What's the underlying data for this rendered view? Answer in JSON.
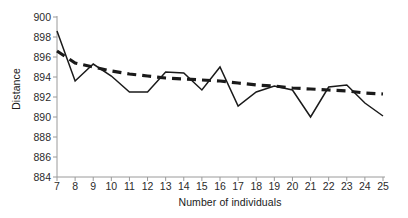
{
  "chart_data": {
    "type": "line",
    "title": "",
    "xlabel": "Number of individuals",
    "ylabel": "Distance",
    "xlim": [
      7,
      25
    ],
    "ylim": [
      884,
      900
    ],
    "ytick_step": 2,
    "grid": false,
    "legend": "none",
    "xticks": [
      7,
      8,
      9,
      10,
      11,
      12,
      13,
      14,
      15,
      16,
      17,
      18,
      19,
      20,
      21,
      22,
      23,
      24,
      25
    ],
    "yticks": [
      884,
      886,
      888,
      890,
      892,
      894,
      896,
      898,
      900
    ],
    "x": [
      7,
      8,
      9,
      10,
      11,
      12,
      13,
      14,
      15,
      16,
      17,
      18,
      19,
      20,
      21,
      22,
      23,
      24,
      25
    ],
    "series": [
      {
        "name": "Distance",
        "style": "solid",
        "color": "#1a1a1a",
        "values": [
          898.6,
          893.6,
          895.3,
          894.1,
          892.5,
          892.5,
          894.5,
          894.4,
          892.7,
          895.0,
          891.1,
          892.5,
          893.1,
          892.7,
          890.0,
          893.0,
          893.2,
          891.4,
          890.1
        ]
      },
      {
        "name": "Trend",
        "style": "dashed",
        "color": "#1a1a1a",
        "values": [
          896.6,
          895.4,
          895.0,
          894.6,
          894.3,
          894.1,
          893.9,
          893.8,
          893.7,
          893.6,
          893.4,
          893.2,
          893.1,
          892.9,
          892.8,
          892.7,
          892.6,
          892.4,
          892.3
        ]
      }
    ],
    "axis_color": "#9a9a9a",
    "tick_color": "#9a9a9a",
    "background": "#ffffff"
  }
}
